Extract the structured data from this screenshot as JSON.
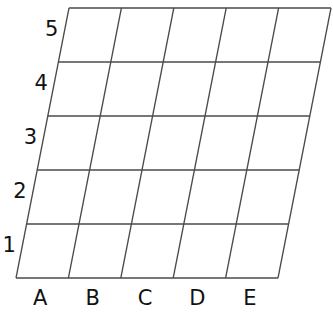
{
  "diagram": {
    "type": "skewed-grid",
    "columns": 5,
    "rows": 5,
    "line_color": "#4a4a4a",
    "corners": {
      "top_left": [
        69,
        8
      ],
      "top_right": [
        331,
        8
      ],
      "bottom_left": [
        16,
        278
      ],
      "bottom_right": [
        278,
        278
      ]
    },
    "column_labels": [
      "A",
      "B",
      "C",
      "D",
      "E"
    ],
    "row_labels": [
      "1",
      "2",
      "3",
      "4",
      "5"
    ]
  }
}
